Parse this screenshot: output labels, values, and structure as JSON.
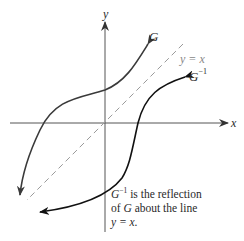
{
  "figure": {
    "axes": {
      "x_label": "x",
      "y_label": "y"
    },
    "line_label": "y = x",
    "curve_g_label": "G",
    "curve_ginv_label_base": "G",
    "curve_ginv_label_exp": "−1",
    "caption": {
      "line1_base": "G",
      "line1_exp": "−1",
      "line1_rest": " is the reflection",
      "line2_pre": "of ",
      "line2_var": "G",
      "line2_post": " about the line",
      "line3": "y = x."
    },
    "colors": {
      "axis": "#555555",
      "curve_g": "#3a3a3a",
      "curve_ginv": "#111111",
      "dashed_line": "#9a9a9a",
      "text": "#2a2a2a"
    }
  }
}
